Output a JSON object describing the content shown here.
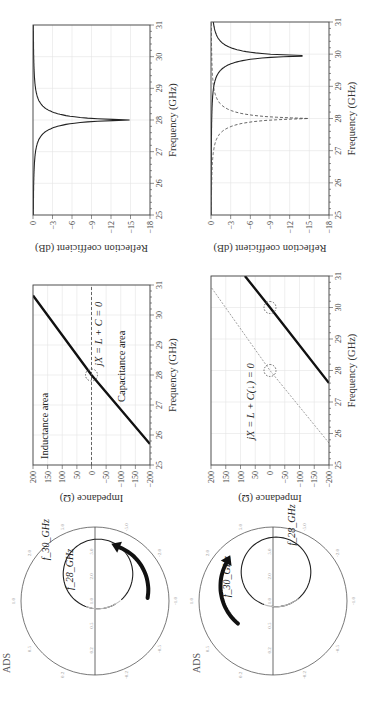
{
  "figure": {
    "orientation": "rotated 90 degrees counter-clockwise",
    "rows": [
      {
        "smith_chart": {
          "label": "ADS",
          "markers": [
            "f_28_GHz",
            "f_30_GHz"
          ],
          "rim_labels": [
            "0.2",
            "0.5",
            "1.0",
            "2.0",
            "5.0",
            "-0.2",
            "-0.5",
            "-1.0",
            "-2.0",
            "-5.0"
          ],
          "real_axis_labels": [
            "0.2",
            "0.5",
            "1.0",
            "2.0",
            "5.0"
          ],
          "arrow_direction": "clockwise"
        },
        "impedance_plot": {
          "ylabel": "Impedance (Ω)",
          "xlabel": "Frequency (GHz)",
          "annotations": [
            "Inductance area",
            "Capacitance area",
            "jX = L + C = 0"
          ]
        },
        "reflection_plot": {
          "ylabel": "Reflection coefficient (dB)",
          "xlabel": "Frequency (GHz)"
        }
      },
      {
        "smith_chart": {
          "label": "ADS",
          "markers": [
            "f_28_GHz",
            "f_30_GHz"
          ],
          "rim_labels": [
            "0.2",
            "0.5",
            "1.0",
            "2.0",
            "5.0",
            "-0.2",
            "-0.5",
            "-1.0",
            "-2.0",
            "-5.0"
          ],
          "real_axis_labels": [
            "0.2",
            "0.5",
            "1.0",
            "2.0",
            "5.0"
          ],
          "arrow_direction": "counter-clockwise"
        },
        "impedance_plot": {
          "ylabel": "Impedance (Ω)",
          "xlabel": "Frequency (GHz)",
          "annotations": [
            "jX = L + C(↓) = 0"
          ]
        },
        "reflection_plot": {
          "ylabel": "Reflection coefficient (dB)",
          "xlabel": "Frequency (GHz)"
        }
      }
    ]
  },
  "chart_data": [
    {
      "type": "line",
      "title": "Impedance vs frequency (row 1)",
      "xlabel": "Frequency (GHz)",
      "ylabel": "Impedance (Ω)",
      "xlim": [
        25,
        31
      ],
      "ylim": [
        -200,
        200
      ],
      "xticks": [
        25,
        26,
        27,
        28,
        29,
        30,
        31
      ],
      "yticks": [
        200,
        150,
        100,
        50,
        0,
        -50,
        -100,
        -150,
        -200
      ],
      "grid": true,
      "series": [
        {
          "name": "jX",
          "style": "solid-thick",
          "x": [
            25.7,
            28.0,
            30.65
          ],
          "y": [
            -200,
            0,
            200
          ]
        },
        {
          "name": "zero line",
          "style": "dashed",
          "x": [
            25,
            31
          ],
          "y": [
            0,
            0
          ]
        }
      ],
      "annotations": [
        {
          "text": "Inductance area",
          "x": 25.3,
          "y": 150
        },
        {
          "text": "Capacitance area",
          "x": 27.3,
          "y": -110
        },
        {
          "text": "jX = L + C = 0",
          "x": 28.4,
          "y": -30
        },
        {
          "text": "resonance circle",
          "x": 28.0,
          "y": 0
        }
      ]
    },
    {
      "type": "line",
      "title": "Reflection coefficient (row 1)",
      "xlabel": "Frequency (GHz)",
      "ylabel": "Reflection coefficient (dB)",
      "xlim": [
        25,
        31
      ],
      "ylim": [
        -18,
        0
      ],
      "xticks": [
        25,
        26,
        27,
        28,
        29,
        30,
        31
      ],
      "yticks": [
        0,
        -3,
        -6,
        -9,
        -12,
        -15,
        -18
      ],
      "grid": true,
      "series": [
        {
          "name": "S11",
          "style": "solid",
          "x": [
            25.0,
            26.0,
            26.5,
            27.0,
            27.5,
            27.8,
            28.0,
            28.2,
            28.5,
            29.0,
            29.5,
            30.0,
            31.0
          ],
          "y": [
            -0.3,
            -1.0,
            -1.8,
            -3.5,
            -7.5,
            -13,
            -18,
            -13,
            -8.5,
            -4.5,
            -2.5,
            -1.4,
            -0.5
          ]
        }
      ]
    },
    {
      "type": "line",
      "title": "Impedance vs frequency (row 2)",
      "xlabel": "Frequency (GHz)",
      "ylabel": "Impedance (Ω)",
      "xlim": [
        25,
        31
      ],
      "ylim": [
        -200,
        200
      ],
      "xticks": [
        25,
        26,
        27,
        28,
        29,
        30,
        31
      ],
      "yticks": [
        200,
        150,
        100,
        50,
        0,
        -50,
        -100,
        -150,
        -200
      ],
      "grid": true,
      "series": [
        {
          "name": "jX shifted",
          "style": "solid-thick",
          "x": [
            27.6,
            30.0,
            31.0
          ],
          "y": [
            -200,
            0,
            85
          ]
        },
        {
          "name": "jX original",
          "style": "dashed-thin",
          "x": [
            25.7,
            28.0,
            30.65
          ],
          "y": [
            -200,
            0,
            200
          ]
        }
      ],
      "annotations": [
        {
          "text": "jX = L + C(↓) = 0",
          "x": 25.8,
          "y": 60
        },
        {
          "text": "circle at 28 GHz",
          "x": 28.0,
          "y": 0
        },
        {
          "text": "circle at 30 GHz",
          "x": 30.0,
          "y": 0
        }
      ]
    },
    {
      "type": "line",
      "title": "Reflection coefficient (row 2)",
      "xlabel": "Frequency (GHz)",
      "ylabel": "Reflection coefficient (dB)",
      "xlim": [
        25,
        31
      ],
      "ylim": [
        -18,
        0
      ],
      "xticks": [
        25,
        26,
        27,
        28,
        29,
        30,
        31
      ],
      "yticks": [
        0,
        -3,
        -6,
        -9,
        -12,
        -15,
        -18
      ],
      "grid": true,
      "series": [
        {
          "name": "S11 shifted",
          "style": "solid",
          "x": [
            25.0,
            26.0,
            27.0,
            28.0,
            28.5,
            29.0,
            29.5,
            29.8,
            30.0,
            30.3,
            30.6,
            31.0
          ],
          "y": [
            -0.1,
            -0.3,
            -0.7,
            -1.6,
            -2.6,
            -4.5,
            -9.5,
            -18,
            -18,
            -9,
            -5,
            -3
          ]
        },
        {
          "name": "S11 original",
          "style": "dashed",
          "x": [
            25.0,
            26.0,
            26.5,
            27.0,
            27.5,
            27.8,
            28.0,
            28.2,
            28.5,
            29.0,
            29.5,
            30.0,
            31.0
          ],
          "y": [
            -0.3,
            -1.0,
            -1.8,
            -3.5,
            -7.5,
            -13,
            -18,
            -13,
            -8.5,
            -4.5,
            -2.5,
            -1.4,
            -0.5
          ]
        }
      ]
    }
  ]
}
